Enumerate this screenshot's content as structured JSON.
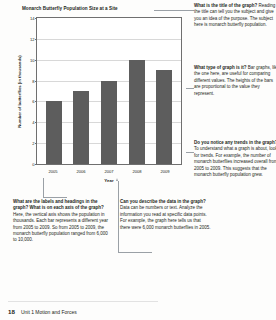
{
  "chart_data": {
    "type": "bar",
    "title": "Monarch Butterfly Population Size at a Site",
    "xlabel": "Year",
    "ylabel": "Number of butterflies (in thousands)",
    "categories": [
      "2005",
      "2006",
      "2007",
      "2008",
      "2009"
    ],
    "values": [
      6,
      7,
      8,
      10,
      9
    ],
    "ylim": [
      0,
      14
    ],
    "yticks": [
      0,
      2,
      4,
      6,
      8,
      10,
      12,
      14
    ],
    "grid": true,
    "legend": "none",
    "bar_color": "#5d5d5d"
  },
  "callouts": {
    "top_right": {
      "question": "What is the title of the graph?",
      "answer": " Reading the title can tell you the subject and give you an idea of the purpose. The subject here is monarch butterfly population."
    },
    "mid_right": {
      "question": "What type of graph is it?",
      "answer": " Bar graphs, like the one here, are useful for comparing different values. The heights of the bars are proportional to the value they represent."
    },
    "low_right": {
      "question": "Do you notice any trends in the graph?",
      "answer": " To understand what a graph is about, look for trends. For example, the number of monarch butterflies increased overall from 2005 to 2009. This suggests that the monarch butterfly population grew."
    },
    "bottom_left": {
      "question": "What are the labels and headings in the graph? What is on each axis of the graph?",
      "answer": " Here, the vertical axis shows the population in thousands. Each bar represents a different year from 2005 to 2009. So from 2005 to 2009, the monarch butterfly population ranged from 6,000 to 10,000."
    },
    "bottom_middle": {
      "question": "Can you describe the data in the graph?",
      "answer": " Data can be numbers or text. Analyze the information you read at specific data points. For example, the graph here tells us that there were 6,000 monarch butterflies in 2005."
    }
  },
  "footer": {
    "page_number": "18",
    "running_head": "Unit 1 Motion and Forces"
  }
}
